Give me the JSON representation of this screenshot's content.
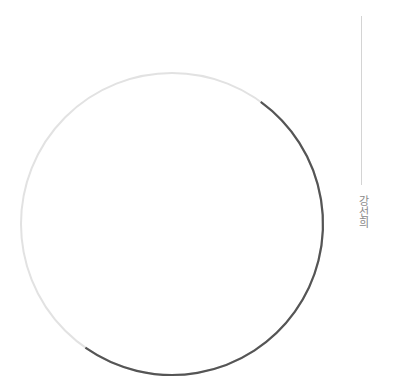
{
  "header": {
    "top_fragment": "· ·"
  },
  "author": {
    "name": "강선희"
  },
  "graphic": {
    "type": "circle-outline",
    "center": [
      172,
      224
    ],
    "radius": 151,
    "base_color": "#e2e2e2",
    "accent_color": "#555555",
    "accent_arc_start_deg": -54,
    "accent_arc_end_deg": 125
  }
}
